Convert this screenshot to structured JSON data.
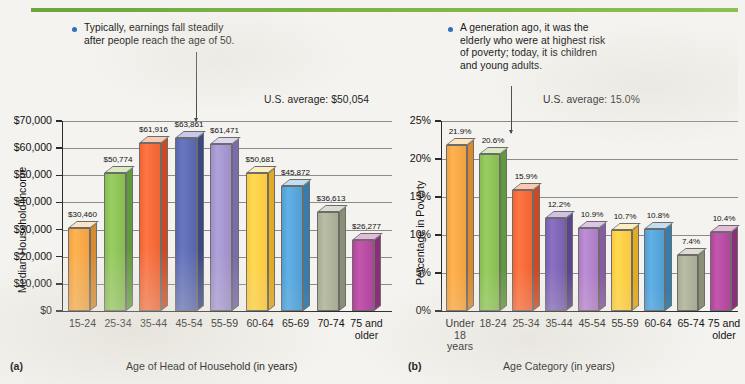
{
  "figure": {
    "rule_color": "#7cb342",
    "background": "#f4f3ef"
  },
  "panel_a": {
    "tag": "(a)",
    "callout": "Typically, earnings fall steadily\nafter people reach the age of 50.",
    "us_average": "U.S. average: $50,054",
    "ytitle": "Median Household Income",
    "xtitle": "Age of Head of Household (in years)",
    "yticks": [
      "$70,000",
      "$60,000",
      "$50,000",
      "$40,000",
      "$30,000",
      "$20,000",
      "$10,000",
      "$0"
    ]
  },
  "panel_b": {
    "tag": "(b)",
    "callout": "A generation ago, it was the\nelderly who were at highest risk\nof poverty; today, it is children\nand young adults.",
    "us_average": "U.S. average: 15.0%",
    "ytitle": "Percentage in Poverty",
    "xtitle": "Age Category (in years)",
    "yticks": [
      "25%",
      "20%",
      "15%",
      "10%",
      "5%",
      "0%"
    ]
  },
  "chart_data": [
    {
      "type": "bar",
      "panel": "a",
      "title": "Median Household Income by Age of Head of Household",
      "xlabel": "Age of Head of Household (in years)",
      "ylabel": "Median Household Income",
      "ylim": [
        0,
        70000
      ],
      "ytick_values": [
        0,
        10000,
        20000,
        30000,
        40000,
        50000,
        60000,
        70000
      ],
      "ytick_labels": [
        "$0",
        "$10,000",
        "$20,000",
        "$30,000",
        "$40,000",
        "$50,000",
        "$60,000",
        "$70,000"
      ],
      "grid": true,
      "reference_line": {
        "label": "U.S. average: $50,054",
        "value": 50054
      },
      "categories": [
        "15-24",
        "25-34",
        "35-44",
        "45-54",
        "55-59",
        "60-64",
        "65-69",
        "70-74",
        "75 and\nolder"
      ],
      "values": [
        30460,
        50774,
        61916,
        63861,
        61471,
        50681,
        45872,
        36613,
        26277
      ],
      "data_labels": [
        "$30,460",
        "$50,774",
        "$61,916",
        "$63,861",
        "$61,471",
        "$50,681",
        "$45,872",
        "$36,613",
        "$26,277"
      ],
      "colors": [
        "#f2a13f",
        "#86bc50",
        "#f06332",
        "#5665ae",
        "#9e8fc8",
        "#fbc83f",
        "#4f9ed4",
        "#a8ab94",
        "#b0459b"
      ],
      "top_colors": [
        "#fbe4c2",
        "#d9eac2",
        "#fbc9b0",
        "#c5caea",
        "#ddd6ee",
        "#fdeec0",
        "#c4def1",
        "#dcddd0",
        "#e3bcdb"
      ],
      "side_colors": [
        "#d98a2e",
        "#5f9a3b",
        "#cf4820",
        "#3b4888",
        "#7b6cae",
        "#e2ab24",
        "#357dae",
        "#8b8f76",
        "#8e2e7b"
      ]
    },
    {
      "type": "bar",
      "panel": "b",
      "title": "Percentage in Poverty by Age Category",
      "xlabel": "Age Category (in years)",
      "ylabel": "Percentage in Poverty",
      "ylim": [
        0,
        25
      ],
      "ytick_values": [
        0,
        5,
        10,
        15,
        20,
        25
      ],
      "ytick_labels": [
        "0%",
        "5%",
        "10%",
        "15%",
        "20%",
        "25%"
      ],
      "grid": true,
      "reference_line": {
        "label": "U.S. average: 15.0%",
        "value": 15.0
      },
      "categories": [
        "Under\n18\nyears",
        "18-24",
        "25-34",
        "35-44",
        "45-54",
        "55-59",
        "60-64",
        "65-74",
        "75 and\nolder"
      ],
      "values": [
        21.9,
        20.6,
        15.9,
        12.2,
        10.9,
        10.7,
        10.8,
        7.4,
        10.4
      ],
      "data_labels": [
        "21.9%",
        "20.6%",
        "15.9%",
        "12.2%",
        "10.9%",
        "10.7%",
        "10.8%",
        "7.4%",
        "10.4%"
      ],
      "colors": [
        "#f2a13f",
        "#86bc50",
        "#f06332",
        "#7a5fb0",
        "#ab7bc4",
        "#fbc83f",
        "#4f9ed4",
        "#a8ab94",
        "#b0459b"
      ],
      "top_colors": [
        "#fbe4c2",
        "#d9eac2",
        "#fbc9b0",
        "#cfc2e4",
        "#ddc4e8",
        "#fdeec0",
        "#c4def1",
        "#dcddd0",
        "#e3bcdb"
      ],
      "side_colors": [
        "#d98a2e",
        "#5f9a3b",
        "#cf4820",
        "#5c4490",
        "#8a5ba5",
        "#e2ab24",
        "#357dae",
        "#8b8f76",
        "#8e2e7b"
      ],
      "note": "rightmost bar clipped at image edge"
    }
  ]
}
